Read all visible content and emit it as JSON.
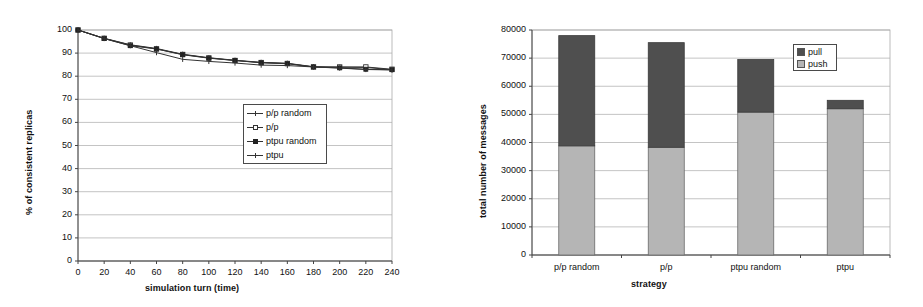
{
  "chart_data": [
    {
      "id": "consistency-over-time",
      "type": "line",
      "title": "",
      "xlabel": "simulation turn (time)",
      "ylabel": "% of consistent replicas",
      "xlim": [
        0,
        240
      ],
      "ylim": [
        0,
        100
      ],
      "xticks": [
        0,
        20,
        40,
        60,
        80,
        100,
        120,
        140,
        160,
        180,
        200,
        220,
        240
      ],
      "yticks": [
        0,
        10,
        20,
        30,
        40,
        50,
        60,
        70,
        80,
        90,
        100
      ],
      "xtick_labels": [
        "0",
        "20",
        "40",
        "60",
        "80",
        "100",
        "120",
        "140",
        "160",
        "180",
        "200",
        "220",
        "240"
      ],
      "ytick_labels": [
        "0",
        "10",
        "20",
        "30",
        "40",
        "50",
        "60",
        "70",
        "80",
        "90",
        "100"
      ],
      "grid": "horizontal",
      "legend_position": "center",
      "x": [
        0,
        20,
        40,
        60,
        80,
        100,
        120,
        140,
        160,
        180,
        200,
        220,
        240
      ],
      "series": [
        {
          "name": "p/p random",
          "marker": "cross",
          "values": [
            100.0,
            96.4,
            93.6,
            92.0,
            89.5,
            88.0,
            86.9,
            86.0,
            85.6,
            84.1,
            83.9,
            83.8,
            82.8
          ]
        },
        {
          "name": "p/p",
          "marker": "open-square",
          "values": [
            100.0,
            96.4,
            93.5,
            91.8,
            89.4,
            87.9,
            86.8,
            85.9,
            85.5,
            84.0,
            84.0,
            84.0,
            83.0
          ]
        },
        {
          "name": "ptpu random",
          "marker": "filled-square",
          "values": [
            100.0,
            96.3,
            93.2,
            91.8,
            89.3,
            87.8,
            86.8,
            85.8,
            85.4,
            84.0,
            83.6,
            83.0,
            82.8
          ]
        },
        {
          "name": "ptpu",
          "marker": "cross",
          "values": [
            100.0,
            96.3,
            93.2,
            90.2,
            87.3,
            86.4,
            85.7,
            84.8,
            84.6,
            84.0,
            83.5,
            82.9,
            82.7
          ]
        }
      ]
    },
    {
      "id": "messages-by-strategy",
      "type": "bar",
      "stacked": true,
      "title": "",
      "xlabel": "strategy",
      "ylabel": "total number of messages",
      "ylim": [
        0,
        80000
      ],
      "yticks": [
        0,
        10000,
        20000,
        30000,
        40000,
        50000,
        60000,
        70000,
        80000
      ],
      "ytick_labels": [
        "0",
        "10000",
        "20000",
        "30000",
        "40000",
        "50000",
        "60000",
        "70000",
        "80000"
      ],
      "grid": "horizontal",
      "legend_position": "top-right",
      "categories": [
        "p/p random",
        "p/p",
        "ptpu random",
        "ptpu"
      ],
      "series": [
        {
          "name": "push",
          "color": "#b5b5b5",
          "values": [
            38800,
            38300,
            50800,
            52000
          ]
        },
        {
          "name": "pull",
          "color": "#4f4f4f",
          "values": [
            39200,
            37200,
            18700,
            3000
          ]
        }
      ],
      "totals": [
        78000,
        75500,
        69500,
        55000
      ]
    }
  ],
  "colors": {
    "push": "#b5b5b5",
    "pull": "#4f4f4f",
    "axis": "#555555",
    "grid": "#aaaaaa",
    "line": "#333333",
    "background": "#ffffff"
  }
}
